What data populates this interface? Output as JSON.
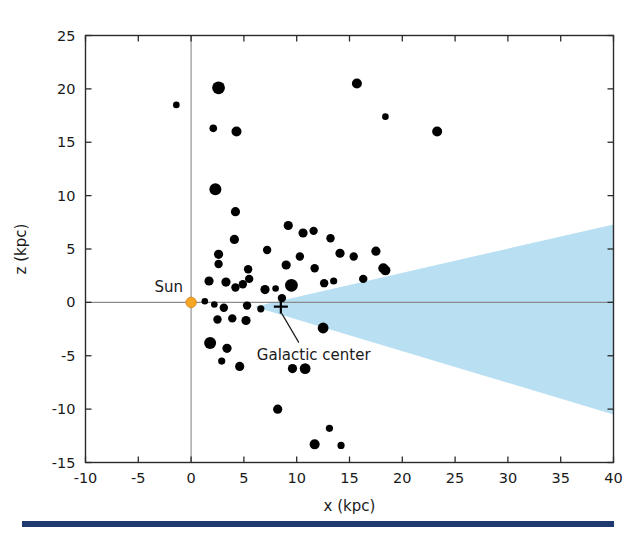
{
  "chart_data": {
    "type": "scatter",
    "title": "",
    "xlabel": "x (kpc)",
    "ylabel": "z (kpc)",
    "xlim": [
      -10,
      40
    ],
    "ylim": [
      -15,
      25
    ],
    "xticks": [
      -10,
      -5,
      0,
      5,
      10,
      15,
      20,
      25,
      30,
      35,
      40
    ],
    "yticks": [
      -15,
      -10,
      -5,
      0,
      5,
      10,
      15,
      20,
      25
    ],
    "xtick_labels": [
      "-10",
      "-5",
      "0",
      "5",
      "10",
      "15",
      "20",
      "25",
      "30",
      "35",
      "40"
    ],
    "ytick_labels": [
      "-15",
      "-10",
      "-5",
      "0",
      "5",
      "10",
      "15",
      "20",
      "25"
    ],
    "grid": false,
    "legend": "none",
    "series": [
      {
        "name": "globular clusters",
        "marker": "filled-circle",
        "color": "#000000",
        "points": [
          {
            "x": -1.4,
            "z": 18.5,
            "r": 3.3
          },
          {
            "x": 2.6,
            "z": 20.1,
            "r": 6.4
          },
          {
            "x": 2.1,
            "z": 16.3,
            "r": 3.8
          },
          {
            "x": 4.3,
            "z": 16.0,
            "r": 5.0
          },
          {
            "x": 15.7,
            "z": 20.5,
            "r": 5.0
          },
          {
            "x": 18.4,
            "z": 17.4,
            "r": 3.3
          },
          {
            "x": 23.3,
            "z": 16.0,
            "r": 5.0
          },
          {
            "x": 2.3,
            "z": 10.6,
            "r": 6.0
          },
          {
            "x": 4.2,
            "z": 8.5,
            "r": 4.6
          },
          {
            "x": 4.1,
            "z": 5.9,
            "r": 4.6
          },
          {
            "x": 9.2,
            "z": 7.2,
            "r": 4.6
          },
          {
            "x": 10.6,
            "z": 6.5,
            "r": 4.6
          },
          {
            "x": 11.6,
            "z": 6.7,
            "r": 4.2
          },
          {
            "x": 13.2,
            "z": 6.0,
            "r": 4.2
          },
          {
            "x": 2.6,
            "z": 4.5,
            "r": 4.6
          },
          {
            "x": 2.6,
            "z": 3.6,
            "r": 4.2
          },
          {
            "x": 5.4,
            "z": 3.1,
            "r": 4.2
          },
          {
            "x": 7.2,
            "z": 4.9,
            "r": 4.2
          },
          {
            "x": 9.0,
            "z": 3.5,
            "r": 4.6
          },
          {
            "x": 10.3,
            "z": 4.3,
            "r": 4.2
          },
          {
            "x": 11.7,
            "z": 3.2,
            "r": 4.2
          },
          {
            "x": 14.1,
            "z": 4.6,
            "r": 4.6
          },
          {
            "x": 15.4,
            "z": 4.3,
            "r": 4.2
          },
          {
            "x": 17.5,
            "z": 4.8,
            "r": 4.6
          },
          {
            "x": 18.2,
            "z": 3.2,
            "r": 5.0
          },
          {
            "x": 18.4,
            "z": 3.0,
            "r": 5.0
          },
          {
            "x": 1.7,
            "z": 2.0,
            "r": 4.6
          },
          {
            "x": 3.3,
            "z": 1.9,
            "r": 4.6
          },
          {
            "x": 4.2,
            "z": 1.4,
            "r": 4.2
          },
          {
            "x": 4.9,
            "z": 1.7,
            "r": 4.2
          },
          {
            "x": 5.5,
            "z": 2.2,
            "r": 4.2
          },
          {
            "x": 7.0,
            "z": 1.2,
            "r": 4.6
          },
          {
            "x": 8.0,
            "z": 1.3,
            "r": 3.3
          },
          {
            "x": 9.5,
            "z": 1.6,
            "r": 6.4
          },
          {
            "x": 12.6,
            "z": 1.8,
            "r": 4.2
          },
          {
            "x": 13.5,
            "z": 2.0,
            "r": 3.6
          },
          {
            "x": 16.3,
            "z": 2.2,
            "r": 4.2
          },
          {
            "x": 1.3,
            "z": 0.1,
            "r": 3.3
          },
          {
            "x": 2.2,
            "z": -0.2,
            "r": 3.3
          },
          {
            "x": 3.1,
            "z": -0.5,
            "r": 4.2
          },
          {
            "x": 5.3,
            "z": -0.3,
            "r": 4.2
          },
          {
            "x": 6.6,
            "z": -0.6,
            "r": 3.6
          },
          {
            "x": 8.6,
            "z": 0.4,
            "r": 4.2
          },
          {
            "x": 2.5,
            "z": -1.6,
            "r": 4.2
          },
          {
            "x": 3.9,
            "z": -1.5,
            "r": 4.2
          },
          {
            "x": 5.2,
            "z": -1.7,
            "r": 4.6
          },
          {
            "x": 12.5,
            "z": -2.4,
            "r": 5.4
          },
          {
            "x": 1.8,
            "z": -3.8,
            "r": 6.0
          },
          {
            "x": 3.4,
            "z": -4.3,
            "r": 4.6
          },
          {
            "x": 2.9,
            "z": -5.5,
            "r": 3.6
          },
          {
            "x": 4.6,
            "z": -6.0,
            "r": 4.6
          },
          {
            "x": 9.6,
            "z": -6.2,
            "r": 4.6
          },
          {
            "x": 10.8,
            "z": -6.2,
            "r": 5.4
          },
          {
            "x": 8.2,
            "z": -10.0,
            "r": 4.6
          },
          {
            "x": 13.1,
            "z": -11.8,
            "r": 3.6
          },
          {
            "x": 11.7,
            "z": -13.3,
            "r": 5.0
          },
          {
            "x": 14.2,
            "z": -13.4,
            "r": 3.6
          }
        ]
      }
    ],
    "markers": [
      {
        "name": "sun",
        "label": "Sun",
        "x": 0,
        "z": 0,
        "color": "#f5a623",
        "symbol": "dot"
      },
      {
        "name": "galactic-center",
        "label": "Galactic center",
        "x": 8.5,
        "z": -0.4,
        "color": "#000000",
        "symbol": "plus"
      }
    ],
    "annotations": [
      {
        "name": "disk-wedge",
        "label": "",
        "color": "#b8dff2",
        "description": "galactic disk flare wedge widening toward +x",
        "apex": {
          "x": 6.0,
          "z": -0.4
        },
        "edge_at_xmax": {
          "x": 40,
          "z_top": 7.3,
          "z_bottom": -10.5
        }
      }
    ]
  },
  "figure": {
    "bottom_bar_color": "#1f3a6e"
  }
}
